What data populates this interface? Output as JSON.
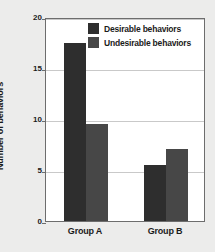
{
  "chart_data": {
    "type": "bar",
    "title": "",
    "subtitle": "",
    "xlabel": "",
    "ylabel": "Number of behaviors",
    "categories": [
      "Group A",
      "Group B"
    ],
    "series": [
      {
        "name": "Desirable behaviors",
        "values": [
          17.5,
          5.5
        ],
        "color": "#2e2e2e"
      },
      {
        "name": "Undesirable behaviors",
        "values": [
          9.5,
          7.1
        ],
        "color": "#474747"
      }
    ],
    "ylim": [
      0,
      20
    ],
    "yticks": [
      0,
      5,
      10,
      15,
      20
    ],
    "ytick_labels": [
      "0",
      "5",
      "10",
      "15",
      "20"
    ],
    "grid": true,
    "grid_axis": "y",
    "legend": {
      "position": "top-right-inside",
      "entries": [
        {
          "label": "Desirable behaviors",
          "color": "#2e2e2e"
        },
        {
          "label": "Undesirable behaviors",
          "color": "#474747"
        }
      ]
    },
    "colors": {
      "figure_background": "#ececeb",
      "plot_background": "#ffffff",
      "axis": "#6d6d6d",
      "gridline": "#c9c9c9",
      "text": "#1b1b1b"
    }
  }
}
